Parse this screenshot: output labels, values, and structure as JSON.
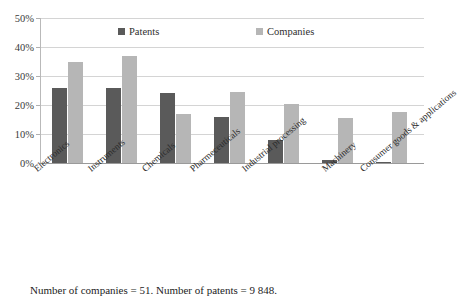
{
  "chart_data": {
    "type": "bar",
    "title": "",
    "categories": [
      "Electronics",
      "Instruments",
      "Chemicals",
      "Pharmeceuticals",
      "Industrial processing",
      "Machinery",
      "Consumer goods & applications"
    ],
    "series": [
      {
        "name": "Patents",
        "color": "#5a5a5a",
        "values": [
          26,
          26,
          24,
          16,
          8,
          1,
          0.5
        ]
      },
      {
        "name": "Companies",
        "color": "#b6b6b6",
        "values": [
          35,
          37,
          17,
          24.5,
          20.5,
          15.5,
          17.5
        ]
      }
    ],
    "xlabel": "",
    "ylabel": "",
    "ylim": [
      0,
      50
    ],
    "yticks": [
      "0%",
      "10%",
      "20%",
      "30%",
      "40%",
      "50%"
    ],
    "ytick_values": [
      0,
      10,
      20,
      30,
      40,
      50
    ],
    "grid": true,
    "legend_position": "top-inside"
  },
  "legend": {
    "patents": "Patents",
    "companies": "Companies"
  },
  "caption": {
    "text": "Number of companies = 51. Number of patents = 9 848."
  }
}
